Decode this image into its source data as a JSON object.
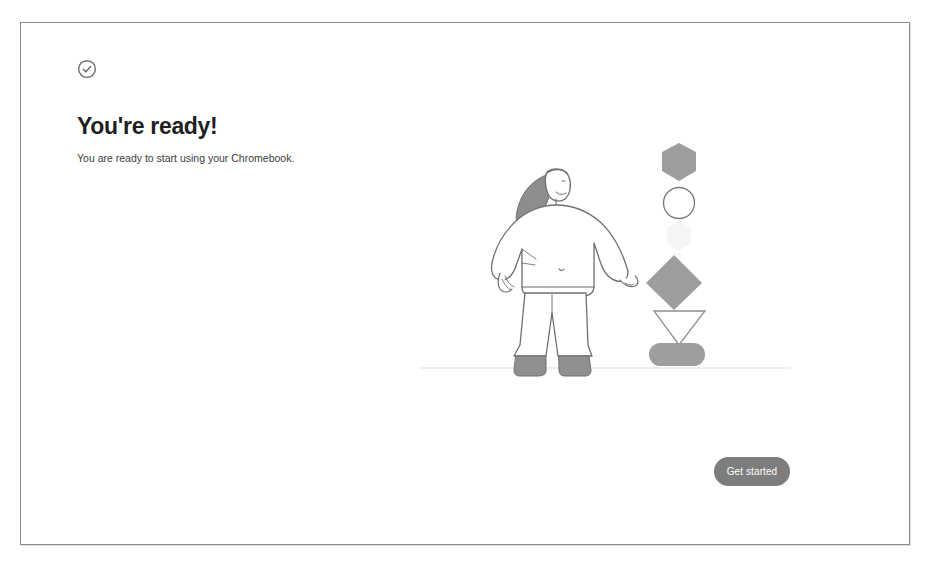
{
  "screen": {
    "name": "chromebook-oobe-ready-screen",
    "background": "#ffffff",
    "frame_border_color": "#8a8a8a"
  },
  "header": {
    "status_icon": "check-circle-icon",
    "status_icon_color": "#6b6b6b",
    "title": "You're ready!",
    "title_color": "#1f1f1f",
    "subtitle": "You are ready to start using your Chromebook.",
    "subtitle_color": "#3c3c3c"
  },
  "illustration": {
    "name": "person-with-shapes-illustration",
    "description": "Line-art person standing beside a vertical stack of geometric shapes above a horizon line",
    "line_color": "#6f6f6f",
    "fill_color": "#9e9e9e",
    "ground_line_color": "#d8d8d8",
    "figure": {
      "name": "standing-person-figure",
      "hair_color": "#8a8a8a",
      "boots_color": "#8f8f8f",
      "outfit_color": "#ffffff"
    },
    "shapes": [
      {
        "name": "hexagon-shape",
        "kind": "hexagon",
        "style": "filled",
        "color": "#9e9e9e"
      },
      {
        "name": "circle-shape",
        "kind": "circle",
        "style": "outline",
        "color": "#7a7a7a"
      },
      {
        "name": "ghost-shape",
        "kind": "faded-mark",
        "style": "faded",
        "color": "#f0f0f0"
      },
      {
        "name": "diamond-shape",
        "kind": "diamond",
        "style": "filled",
        "color": "#9e9e9e"
      },
      {
        "name": "triangle-shape",
        "kind": "triangle-down",
        "style": "outline",
        "color": "#8d8d8d"
      },
      {
        "name": "rounded-rectangle-shape",
        "kind": "rounded-rectangle",
        "style": "filled",
        "color": "#9e9e9e"
      }
    ]
  },
  "footer": {
    "get_started_label": "Get started",
    "button_color": "#7d7d7d",
    "button_text_color": "#ffffff"
  }
}
